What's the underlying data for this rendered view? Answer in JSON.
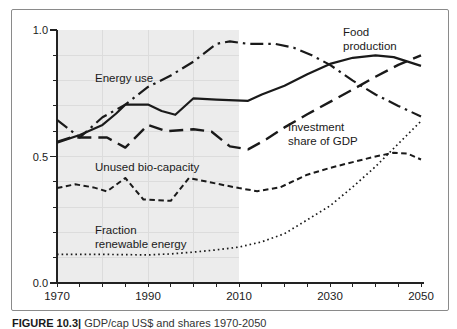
{
  "figure": {
    "caption_prefix": "FIGURE 10.3|",
    "caption_rest": " GDP/cap US$ and shares 1970-2050"
  },
  "chart_data": {
    "type": "line",
    "title": "",
    "xlabel": "",
    "ylabel": "",
    "xlim": [
      1970,
      2050
    ],
    "ylim": [
      0.0,
      1.0
    ],
    "grid": "light gridlines inside shaded history band only",
    "legend_position": "inline-labels",
    "history_region": [
      1970,
      2010
    ],
    "x_tick_minor_step": 5,
    "x_tick_labels": [
      1970,
      1990,
      2010,
      2030,
      2050
    ],
    "y_tick_minor_step": 0.1,
    "y_ticks": [
      {
        "value": 1.0,
        "label": "1.0"
      },
      {
        "value": 0.5,
        "label": "0.5"
      },
      {
        "value": 0.0,
        "label": "0.0"
      }
    ],
    "grid_x_years": [
      1980,
      1990,
      2000
    ],
    "grid_y_values": [
      0.1,
      0.2,
      0.3,
      0.4,
      0.5,
      0.6,
      0.7,
      0.8,
      0.9
    ],
    "colors": {
      "line": "#1a1a1a",
      "history_fill": "#ececec",
      "grid": "#dcdcdc",
      "axis": "#222222",
      "border": "#8a8a8a",
      "label": "#1a1a1a"
    },
    "series": [
      {
        "name": "Food production",
        "style": "solid",
        "points": [
          [
            1970,
            0.555
          ],
          [
            1975,
            0.585
          ],
          [
            1980,
            0.625
          ],
          [
            1983,
            0.67
          ],
          [
            1985,
            0.705
          ],
          [
            1990,
            0.705
          ],
          [
            1993,
            0.68
          ],
          [
            1996,
            0.665
          ],
          [
            2000,
            0.73
          ],
          [
            2005,
            0.725
          ],
          [
            2012,
            0.72
          ],
          [
            2015,
            0.745
          ],
          [
            2020,
            0.78
          ],
          [
            2025,
            0.825
          ],
          [
            2030,
            0.866
          ],
          [
            2035,
            0.89
          ],
          [
            2040,
            0.9
          ],
          [
            2044,
            0.893
          ],
          [
            2050,
            0.858
          ]
        ]
      },
      {
        "name": "Energy use",
        "style": "dashdot",
        "points": [
          [
            1970,
            0.645
          ],
          [
            1975,
            0.575
          ],
          [
            1980,
            0.655
          ],
          [
            1985,
            0.705
          ],
          [
            1990,
            0.775
          ],
          [
            1995,
            0.82
          ],
          [
            2000,
            0.875
          ],
          [
            2005,
            0.945
          ],
          [
            2008,
            0.955
          ],
          [
            2012,
            0.945
          ],
          [
            2018,
            0.945
          ],
          [
            2022,
            0.93
          ],
          [
            2026,
            0.9
          ],
          [
            2030,
            0.862
          ],
          [
            2035,
            0.8
          ],
          [
            2040,
            0.745
          ],
          [
            2045,
            0.7
          ],
          [
            2050,
            0.658
          ]
        ]
      },
      {
        "name": "Investment share of GDP",
        "style": "longdash",
        "points": [
          [
            1970,
            0.558
          ],
          [
            1973,
            0.575
          ],
          [
            1981,
            0.575
          ],
          [
            1985,
            0.535
          ],
          [
            1990,
            0.625
          ],
          [
            1994,
            0.6
          ],
          [
            2000,
            0.608
          ],
          [
            2004,
            0.598
          ],
          [
            2008,
            0.54
          ],
          [
            2012,
            0.528
          ],
          [
            2016,
            0.568
          ],
          [
            2020,
            0.615
          ],
          [
            2025,
            0.667
          ],
          [
            2030,
            0.716
          ],
          [
            2035,
            0.765
          ],
          [
            2040,
            0.815
          ],
          [
            2045,
            0.862
          ],
          [
            2050,
            0.9
          ]
        ]
      },
      {
        "name": "Unused bio-capacity",
        "style": "shortdash",
        "points": [
          [
            1970,
            0.375
          ],
          [
            1974,
            0.39
          ],
          [
            1978,
            0.378
          ],
          [
            1981,
            0.362
          ],
          [
            1985,
            0.415
          ],
          [
            1989,
            0.33
          ],
          [
            1995,
            0.325
          ],
          [
            1999,
            0.415
          ],
          [
            2005,
            0.393
          ],
          [
            2010,
            0.375
          ],
          [
            2014,
            0.363
          ],
          [
            2019,
            0.378
          ],
          [
            2025,
            0.428
          ],
          [
            2030,
            0.455
          ],
          [
            2035,
            0.478
          ],
          [
            2040,
            0.5
          ],
          [
            2044,
            0.515
          ],
          [
            2047,
            0.512
          ],
          [
            2050,
            0.488
          ]
        ]
      },
      {
        "name": "Fraction renewable energy",
        "style": "dotted",
        "points": [
          [
            1970,
            0.113
          ],
          [
            1980,
            0.113
          ],
          [
            1990,
            0.111
          ],
          [
            1995,
            0.115
          ],
          [
            2000,
            0.122
          ],
          [
            2005,
            0.131
          ],
          [
            2010,
            0.142
          ],
          [
            2015,
            0.163
          ],
          [
            2020,
            0.195
          ],
          [
            2025,
            0.25
          ],
          [
            2030,
            0.305
          ],
          [
            2035,
            0.38
          ],
          [
            2040,
            0.46
          ],
          [
            2045,
            0.55
          ],
          [
            2050,
            0.64
          ]
        ]
      }
    ],
    "annotations": [
      {
        "id": "energy-use",
        "lines": [
          "Energy use"
        ],
        "x": 83,
        "y": 62
      },
      {
        "id": "food-production",
        "lines": [
          "Food",
          "production"
        ],
        "x": 331,
        "y": 16
      },
      {
        "id": "investment-share",
        "lines": [
          "Investment",
          "share of GDP"
        ],
        "x": 276,
        "y": 111
      },
      {
        "id": "unused-biocapacity",
        "lines": [
          "Unused bio-capacity"
        ],
        "x": 83,
        "y": 151
      },
      {
        "id": "fraction-renewable",
        "lines": [
          "Fraction",
          "renewable energy"
        ],
        "x": 83,
        "y": 214
      }
    ]
  }
}
